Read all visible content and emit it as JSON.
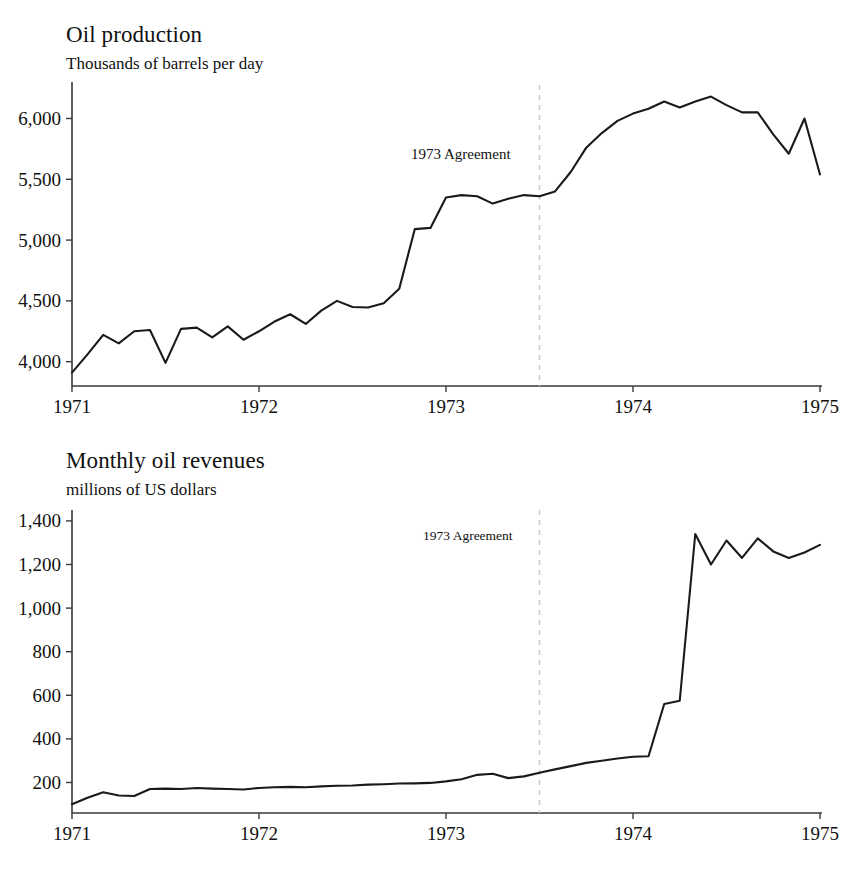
{
  "figure": {
    "background": "#ffffff",
    "line_color": "#1a1a1a",
    "event_line_color": "#c8c8c8",
    "axis_color": "#3a3a3a"
  },
  "panels": {
    "production": {
      "title": "Oil production",
      "subtitle": "Thousands of barrels per day",
      "annotation": "1973 Agreement"
    },
    "revenues": {
      "title": "Monthly oil revenues",
      "subtitle": "millions of US dollars",
      "annotation": "1973 Agreement"
    }
  },
  "chart_data": [
    {
      "type": "line",
      "title": "Oil production",
      "subtitle": "Thousands of barrels per day",
      "xlabel": "",
      "ylabel": "Thousands of barrels per day",
      "xticklabels": [
        "1971",
        "1972",
        "1973",
        "1974",
        "1975"
      ],
      "xtickvalues": [
        1971,
        1972,
        1973,
        1974,
        1975
      ],
      "yticklabels": [
        "4,000",
        "4,500",
        "5,000",
        "5,500",
        "6,000"
      ],
      "ytickvalues": [
        4000,
        4500,
        5000,
        5500,
        6000
      ],
      "xlim": [
        1971.0,
        1975.0
      ],
      "ylim": [
        3800,
        6300
      ],
      "grid": false,
      "legend": false,
      "annotations": [
        {
          "text": "1973 Agreement",
          "x": 1973.5,
          "type": "vertical-dashed-line"
        }
      ],
      "series": [
        {
          "name": "Oil production",
          "x": [
            1971.0,
            1971.083,
            1971.167,
            1971.25,
            1971.333,
            1971.417,
            1971.5,
            1971.583,
            1971.667,
            1971.75,
            1971.833,
            1971.917,
            1972.0,
            1972.083,
            1972.167,
            1972.25,
            1972.333,
            1972.417,
            1972.5,
            1972.583,
            1972.667,
            1972.75,
            1972.833,
            1972.917,
            1973.0,
            1973.083,
            1973.167,
            1973.25,
            1973.333,
            1973.417,
            1973.5,
            1973.583,
            1973.667,
            1973.75,
            1973.833,
            1973.917,
            1974.0,
            1974.083,
            1974.167,
            1974.25,
            1974.333,
            1974.417,
            1974.5,
            1974.583,
            1974.667,
            1974.75,
            1974.833,
            1974.917,
            1975.0
          ],
          "values": [
            3910,
            4060,
            4220,
            4150,
            4250,
            4260,
            3990,
            4270,
            4280,
            4200,
            4290,
            4180,
            4250,
            4330,
            4390,
            4310,
            4420,
            4500,
            4450,
            4445,
            4480,
            4600,
            5090,
            5100,
            5350,
            5370,
            5360,
            5300,
            5340,
            5370,
            5360,
            5400,
            5560,
            5760,
            5880,
            5980,
            6040,
            6080,
            6140,
            6090,
            6140,
            6180,
            6110,
            6050,
            6050,
            5870,
            5710,
            6000,
            5540
          ]
        }
      ]
    },
    {
      "type": "line",
      "title": "Monthly oil revenues",
      "subtitle": "millions of US dollars",
      "xlabel": "",
      "ylabel": "millions of US dollars",
      "xticklabels": [
        "1971",
        "1972",
        "1973",
        "1974",
        "1975"
      ],
      "xtickvalues": [
        1971,
        1972,
        1973,
        1974,
        1975
      ],
      "yticklabels": [
        "200",
        "400",
        "600",
        "800",
        "1,000",
        "1,200",
        "1,400"
      ],
      "ytickvalues": [
        200,
        400,
        600,
        800,
        1000,
        1200,
        1400
      ],
      "xlim": [
        1971.0,
        1975.0
      ],
      "ylim": [
        60,
        1450
      ],
      "grid": false,
      "legend": false,
      "annotations": [
        {
          "text": "1973 Agreement",
          "x": 1973.5,
          "type": "vertical-dashed-line"
        }
      ],
      "series": [
        {
          "name": "Monthly oil revenues",
          "x": [
            1971.0,
            1971.083,
            1971.167,
            1971.25,
            1971.333,
            1971.417,
            1971.5,
            1971.583,
            1971.667,
            1971.75,
            1971.833,
            1971.917,
            1972.0,
            1972.083,
            1972.167,
            1972.25,
            1972.333,
            1972.417,
            1972.5,
            1972.583,
            1972.667,
            1972.75,
            1972.833,
            1972.917,
            1973.0,
            1973.083,
            1973.167,
            1973.25,
            1973.333,
            1973.417,
            1973.5,
            1973.583,
            1973.667,
            1973.75,
            1973.833,
            1973.917,
            1974.0,
            1974.083,
            1974.167,
            1974.25,
            1974.333,
            1974.417,
            1974.5,
            1974.583,
            1974.667,
            1974.75,
            1974.833,
            1974.917,
            1975.0
          ],
          "values": [
            100,
            130,
            155,
            140,
            138,
            170,
            172,
            170,
            175,
            172,
            170,
            168,
            175,
            178,
            180,
            178,
            182,
            185,
            186,
            190,
            192,
            195,
            196,
            198,
            205,
            215,
            235,
            240,
            220,
            228,
            245,
            260,
            275,
            290,
            300,
            310,
            318,
            320,
            560,
            575,
            1340,
            1200,
            1310,
            1230,
            1320,
            1260,
            1230,
            1255,
            1290
          ]
        }
      ]
    }
  ]
}
